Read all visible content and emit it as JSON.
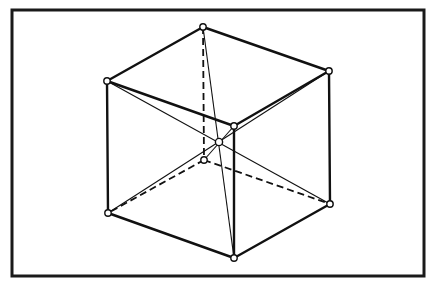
{
  "figure": {
    "frame": {
      "x": 12,
      "y": 10,
      "width": 412,
      "height": 266
    },
    "vertices": [
      {
        "id": "top-back",
        "x": 203,
        "y": 27
      },
      {
        "id": "top-left",
        "x": 107,
        "y": 81
      },
      {
        "id": "top-right",
        "x": 329,
        "y": 71
      },
      {
        "id": "top-front",
        "x": 234,
        "y": 126
      },
      {
        "id": "bottom-back",
        "x": 204,
        "y": 160
      },
      {
        "id": "bottom-left",
        "x": 108,
        "y": 213
      },
      {
        "id": "bottom-right",
        "x": 330,
        "y": 204
      },
      {
        "id": "bottom-front",
        "x": 234,
        "y": 258
      },
      {
        "id": "center",
        "x": 219,
        "y": 142
      }
    ],
    "solid_edges": [
      [
        "top-back",
        "top-left"
      ],
      [
        "top-back",
        "top-right"
      ],
      [
        "top-left",
        "top-front"
      ],
      [
        "top-right",
        "top-front"
      ],
      [
        "top-left",
        "bottom-left"
      ],
      [
        "top-right",
        "bottom-right"
      ],
      [
        "top-front",
        "bottom-front"
      ],
      [
        "bottom-left",
        "bottom-front"
      ],
      [
        "bottom-right",
        "bottom-front"
      ]
    ],
    "hidden_edges": [
      [
        "top-back",
        "bottom-back"
      ],
      [
        "bottom-back",
        "bottom-left"
      ],
      [
        "bottom-back",
        "bottom-right"
      ]
    ],
    "body_diagonals": [
      [
        "top-back",
        "bottom-front"
      ],
      [
        "top-left",
        "bottom-right"
      ],
      [
        "top-right",
        "bottom-left"
      ],
      [
        "top-front",
        "bottom-back"
      ]
    ]
  }
}
